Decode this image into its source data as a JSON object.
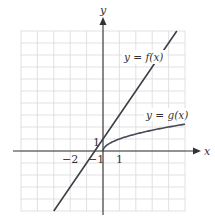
{
  "chart_data": {
    "type": "line",
    "title": "",
    "xlabel": "x",
    "ylabel": "y",
    "xlim": [
      -5,
      5
    ],
    "ylim": [
      -5,
      10
    ],
    "grid": true,
    "grid_step": {
      "x": 1,
      "y": 1
    },
    "tick_labels": {
      "x": [
        {
          "value": -2,
          "label": "−2"
        },
        {
          "value": 1,
          "label": "1"
        }
      ],
      "y": [
        {
          "value": 1,
          "label": "1"
        },
        {
          "value": -1,
          "label": "−1"
        }
      ]
    },
    "series": [
      {
        "name": "y = f(x)",
        "label": "y = f(x)",
        "formula": "f(x) = 2x + 1",
        "x": [
          -3,
          -2,
          -1,
          0,
          1,
          2,
          3,
          4,
          4.5
        ],
        "y": [
          -5,
          -3,
          -1,
          1,
          3,
          5,
          7,
          9,
          10
        ],
        "color": "#3b3f48"
      },
      {
        "name": "y = g(x)",
        "label": "y = g(x)",
        "formula": "g(x) = sqrt(x)",
        "x": [
          0,
          0.25,
          0.5,
          1,
          2,
          3,
          4,
          5
        ],
        "y": [
          0,
          0.5,
          0.71,
          1,
          1.41,
          1.73,
          2,
          2.24
        ],
        "color": "#454a55"
      }
    ],
    "annotations": [
      {
        "text": "y = f(x)",
        "near": [
          2.5,
          7.6
        ]
      },
      {
        "text": "y = g(x)",
        "near": [
          3.2,
          2.8
        ]
      }
    ]
  },
  "axes": {
    "x_label": "x",
    "y_label": "y",
    "axis_color": "#333333",
    "grid_color": "#d9d9d9"
  }
}
